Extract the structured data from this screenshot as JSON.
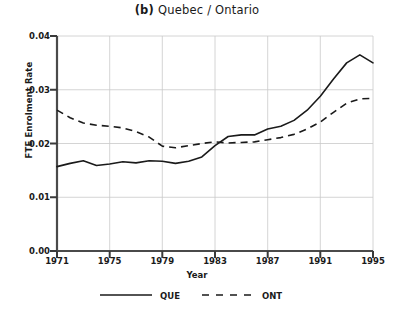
{
  "chart_data": {
    "type": "line",
    "title_label": "(b)",
    "title_text": "Quebec / Ontario",
    "xlabel": "Year",
    "ylabel": "FTE Enrolment Rate",
    "grid": true,
    "legend_position": "below",
    "xlim": [
      1971,
      1995
    ],
    "ylim": [
      0.0,
      0.04
    ],
    "xticks": [
      1971,
      1975,
      1979,
      1983,
      1987,
      1991,
      1995
    ],
    "xtick_labels": [
      "1971",
      "1975",
      "1979",
      "1983",
      "1987",
      "1991",
      "1995"
    ],
    "yticks": [
      0.0,
      0.01,
      0.02,
      0.03,
      0.04
    ],
    "ytick_labels": [
      "0.00",
      "0.01",
      "0.02",
      "0.03",
      "0.04"
    ],
    "x": [
      1971,
      1972,
      1973,
      1974,
      1975,
      1976,
      1977,
      1978,
      1979,
      1980,
      1981,
      1982,
      1983,
      1984,
      1985,
      1986,
      1987,
      1988,
      1989,
      1990,
      1991,
      1992,
      1993,
      1994,
      1995
    ],
    "series": [
      {
        "name": "QUE",
        "style": "solid",
        "color": "#1a1a1a",
        "values": [
          0.0157,
          0.0163,
          0.0168,
          0.0159,
          0.0162,
          0.0166,
          0.0164,
          0.0168,
          0.0167,
          0.0163,
          0.0167,
          0.0175,
          0.0196,
          0.0213,
          0.0216,
          0.0216,
          0.0227,
          0.0232,
          0.0243,
          0.0262,
          0.0288,
          0.032,
          0.035,
          0.0365,
          0.035
        ]
      },
      {
        "name": "ONT",
        "style": "dashed",
        "color": "#1a1a1a",
        "values": [
          0.0262,
          0.0248,
          0.0238,
          0.0234,
          0.0232,
          0.0229,
          0.0222,
          0.0212,
          0.0195,
          0.0192,
          0.0196,
          0.02,
          0.0203,
          0.0201,
          0.0202,
          0.0203,
          0.0207,
          0.0211,
          0.0217,
          0.0227,
          0.024,
          0.0258,
          0.0275,
          0.0283,
          0.0284
        ]
      }
    ],
    "legend": [
      {
        "label": "QUE",
        "style": "solid"
      },
      {
        "label": "ONT",
        "style": "dashed"
      }
    ]
  }
}
